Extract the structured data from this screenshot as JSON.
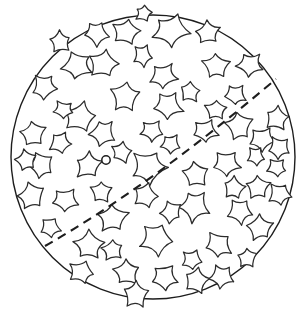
{
  "figure": {
    "background_color": "#ffffff",
    "canvas": {
      "width": 304,
      "height": 313
    }
  },
  "ball": {
    "label": "ball-outline",
    "center_x": 153,
    "center_y": 157,
    "radius": 142,
    "stroke_color": "#1d1d1d",
    "stroke_width": 1.4,
    "fill": "none"
  },
  "seam": {
    "label": "dashed-seam-line",
    "stroke_color": "#1d1d1d",
    "stroke_width": 2.1,
    "dash_length": 9,
    "gap_length": 6,
    "start_point": {
      "x": 45,
      "y": 246
    },
    "control_point": {
      "x": 150,
      "y": 186
    },
    "end_point": {
      "x": 276,
      "y": 79
    }
  },
  "marker": {
    "label": "center-point-marker",
    "x": 106,
    "y": 160,
    "radius": 4.2,
    "stroke_color": "#1d1d1d",
    "fill_color": "#ffffff"
  },
  "stars": {
    "label": "star-pattern",
    "count": 64,
    "stroke_color": "#2b2b2b",
    "fill_color": "#ffffff",
    "stroke_width": 1.25,
    "points_per_star": 5,
    "items": [
      {
        "cx": 96,
        "cy": 33,
        "r": 13,
        "rot": 18,
        "inner": 0.47
      },
      {
        "cx": 126,
        "cy": 32,
        "r": 15,
        "rot": -10,
        "inner": 0.46
      },
      {
        "cx": 171,
        "cy": 30,
        "r": 18,
        "rot": 8,
        "inner": 0.45
      },
      {
        "cx": 208,
        "cy": 33,
        "r": 13,
        "rot": -22,
        "inner": 0.48
      },
      {
        "cx": 77,
        "cy": 65,
        "r": 15,
        "rot": 30,
        "inner": 0.46
      },
      {
        "cx": 104,
        "cy": 64,
        "r": 15,
        "rot": -5,
        "inner": 0.46
      },
      {
        "cx": 163,
        "cy": 76,
        "r": 14,
        "rot": 15,
        "inner": 0.47
      },
      {
        "cx": 216,
        "cy": 66,
        "r": 14,
        "rot": -18,
        "inner": 0.46
      },
      {
        "cx": 250,
        "cy": 65,
        "r": 13,
        "rot": 25,
        "inner": 0.47
      },
      {
        "cx": 44,
        "cy": 87,
        "r": 13,
        "rot": 12,
        "inner": 0.47
      },
      {
        "cx": 125,
        "cy": 97,
        "r": 17,
        "rot": -14,
        "inner": 0.45
      },
      {
        "cx": 168,
        "cy": 106,
        "r": 15,
        "rot": 20,
        "inner": 0.46
      },
      {
        "cx": 80,
        "cy": 118,
        "r": 16,
        "rot": -8,
        "inner": 0.46
      },
      {
        "cx": 103,
        "cy": 133,
        "r": 13,
        "rot": 28,
        "inner": 0.47
      },
      {
        "cx": 33,
        "cy": 134,
        "r": 14,
        "rot": -20,
        "inner": 0.47
      },
      {
        "cx": 205,
        "cy": 131,
        "r": 13,
        "rot": 10,
        "inner": 0.47
      },
      {
        "cx": 239,
        "cy": 126,
        "r": 14,
        "rot": -26,
        "inner": 0.46
      },
      {
        "cx": 262,
        "cy": 139,
        "r": 13,
        "rot": 16,
        "inner": 0.47
      },
      {
        "cx": 277,
        "cy": 118,
        "r": 12,
        "rot": -6,
        "inner": 0.48
      },
      {
        "cx": 279,
        "cy": 148,
        "r": 12,
        "rot": 22,
        "inner": 0.47
      },
      {
        "cx": 88,
        "cy": 166,
        "r": 14,
        "rot": -12,
        "inner": 0.46
      },
      {
        "cx": 148,
        "cy": 168,
        "r": 18,
        "rot": 6,
        "inner": 0.45
      },
      {
        "cx": 196,
        "cy": 175,
        "r": 14,
        "rot": -24,
        "inner": 0.47
      },
      {
        "cx": 226,
        "cy": 164,
        "r": 14,
        "rot": 14,
        "inner": 0.46
      },
      {
        "cx": 41,
        "cy": 165,
        "r": 14,
        "rot": 32,
        "inner": 0.47
      },
      {
        "cx": 258,
        "cy": 187,
        "r": 13,
        "rot": -16,
        "inner": 0.47
      },
      {
        "cx": 280,
        "cy": 194,
        "r": 12,
        "rot": 8,
        "inner": 0.48
      },
      {
        "cx": 32,
        "cy": 196,
        "r": 14,
        "rot": -28,
        "inner": 0.47
      },
      {
        "cx": 65,
        "cy": 200,
        "r": 13,
        "rot": 18,
        "inner": 0.47
      },
      {
        "cx": 145,
        "cy": 196,
        "r": 13,
        "rot": -4,
        "inner": 0.47
      },
      {
        "cx": 194,
        "cy": 206,
        "r": 16,
        "rot": 24,
        "inner": 0.45
      },
      {
        "cx": 113,
        "cy": 218,
        "r": 15,
        "rot": -18,
        "inner": 0.46
      },
      {
        "cx": 240,
        "cy": 211,
        "r": 13,
        "rot": 12,
        "inner": 0.47
      },
      {
        "cx": 260,
        "cy": 228,
        "r": 13,
        "rot": -22,
        "inner": 0.47
      },
      {
        "cx": 157,
        "cy": 239,
        "r": 17,
        "rot": 10,
        "inner": 0.45
      },
      {
        "cx": 89,
        "cy": 246,
        "r": 15,
        "rot": -14,
        "inner": 0.46
      },
      {
        "cx": 218,
        "cy": 245,
        "r": 14,
        "rot": 26,
        "inner": 0.46
      },
      {
        "cx": 82,
        "cy": 272,
        "r": 13,
        "rot": 4,
        "inner": 0.47
      },
      {
        "cx": 127,
        "cy": 272,
        "r": 14,
        "rot": -20,
        "inner": 0.46
      },
      {
        "cx": 164,
        "cy": 277,
        "r": 14,
        "rot": 16,
        "inner": 0.46
      },
      {
        "cx": 196,
        "cy": 281,
        "r": 13,
        "rot": -8,
        "inner": 0.47
      },
      {
        "cx": 222,
        "cy": 277,
        "r": 12,
        "rot": 22,
        "inner": 0.48
      },
      {
        "cx": 136,
        "cy": 295,
        "r": 13,
        "rot": -16,
        "inner": 0.47
      },
      {
        "cx": 152,
        "cy": 131,
        "r": 11,
        "rot": 14,
        "inner": 0.48
      },
      {
        "cx": 60,
        "cy": 42,
        "r": 11,
        "rot": -24,
        "inner": 0.48
      },
      {
        "cx": 143,
        "cy": 56,
        "r": 11,
        "rot": 6,
        "inner": 0.48
      },
      {
        "cx": 190,
        "cy": 92,
        "r": 11,
        "rot": -12,
        "inner": 0.48
      },
      {
        "cx": 235,
        "cy": 95,
        "r": 11,
        "rot": 20,
        "inner": 0.48
      },
      {
        "cx": 26,
        "cy": 160,
        "r": 11,
        "rot": -30,
        "inner": 0.48
      },
      {
        "cx": 60,
        "cy": 143,
        "r": 11,
        "rot": 10,
        "inner": 0.48
      },
      {
        "cx": 122,
        "cy": 152,
        "r": 11,
        "rot": -6,
        "inner": 0.48
      },
      {
        "cx": 171,
        "cy": 144,
        "r": 11,
        "rot": 18,
        "inner": 0.48
      },
      {
        "cx": 216,
        "cy": 110,
        "r": 11,
        "rot": -20,
        "inner": 0.48
      },
      {
        "cx": 50,
        "cy": 227,
        "r": 11,
        "rot": 12,
        "inner": 0.48
      },
      {
        "cx": 101,
        "cy": 192,
        "r": 11,
        "rot": -14,
        "inner": 0.48
      },
      {
        "cx": 171,
        "cy": 212,
        "r": 11,
        "rot": 28,
        "inner": 0.48
      },
      {
        "cx": 234,
        "cy": 188,
        "r": 11,
        "rot": -10,
        "inner": 0.48
      },
      {
        "cx": 277,
        "cy": 168,
        "r": 10,
        "rot": 16,
        "inner": 0.49
      },
      {
        "cx": 113,
        "cy": 250,
        "r": 11,
        "rot": -26,
        "inner": 0.48
      },
      {
        "cx": 192,
        "cy": 260,
        "r": 11,
        "rot": 8,
        "inner": 0.48
      },
      {
        "cx": 247,
        "cy": 258,
        "r": 11,
        "rot": -18,
        "inner": 0.48
      },
      {
        "cx": 64,
        "cy": 110,
        "r": 10,
        "rot": 24,
        "inner": 0.49
      },
      {
        "cx": 144,
        "cy": 13,
        "r": 9,
        "rot": -8,
        "inner": 0.49
      },
      {
        "cx": 256,
        "cy": 156,
        "r": 10,
        "rot": 14,
        "inner": 0.49
      }
    ]
  }
}
